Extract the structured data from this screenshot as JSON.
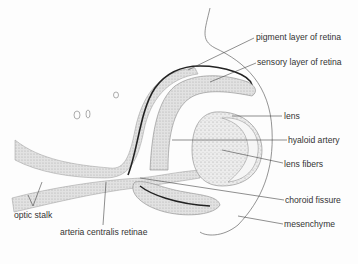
{
  "figure": {
    "labels": {
      "pigment": "pigment layer of retina",
      "sensory": "sensory layer of retina",
      "lens": "lens",
      "hyaloid": "hyaloid artery",
      "lens_fibers": "lens fibers",
      "choroid": "choroid fissure",
      "mesenchyme": "mesenchyme",
      "optic_stalk": "optic stalk",
      "arteria": "arteria centralis retinae"
    }
  }
}
